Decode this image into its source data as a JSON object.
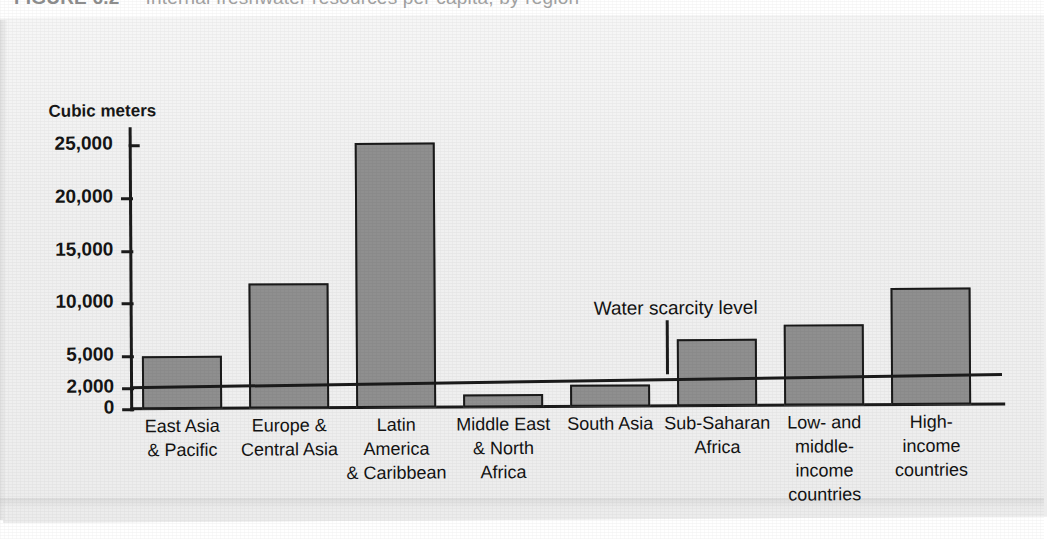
{
  "caption": {
    "number": "FIGURE 6.2",
    "text": "Internal freshwater resources per capita, by region"
  },
  "chart_data": {
    "type": "bar",
    "title": "",
    "ylabel": "Cubic meters",
    "xlabel": "",
    "ylim": [
      0,
      25000
    ],
    "grid": false,
    "legend": "none",
    "ytick_labels": [
      "25,000",
      "20,000",
      "15,000",
      "10,000",
      "5,000",
      "2,000",
      "0"
    ],
    "ytick_values": [
      25000,
      20000,
      15000,
      10000,
      5000,
      2000,
      0
    ],
    "categories": [
      "East Asia & Pacific",
      "Europe & Central Asia",
      "Latin America & Caribbean",
      "Middle East & North Africa",
      "South Asia",
      "Sub-Saharan Africa",
      "Low- and middle-income countries",
      "High-income countries"
    ],
    "category_lines": [
      [
        "East Asia",
        "& Pacific"
      ],
      [
        "Europe &",
        "Central Asia"
      ],
      [
        "Latin",
        "America",
        "& Caribbean"
      ],
      [
        "Middle East",
        "& North",
        "Africa"
      ],
      [
        "South Asia"
      ],
      [
        "Sub-Saharan",
        "Africa"
      ],
      [
        "Low- and",
        "middle-",
        "income",
        "countries"
      ],
      [
        "High-",
        "income",
        "countries"
      ]
    ],
    "values": [
      5000,
      11800,
      25100,
      1200,
      2100,
      6300,
      7700,
      11100
    ],
    "annotations": [
      {
        "label": "Water scarcity level",
        "value": 2000,
        "type": "horizontal-reference-line"
      }
    ],
    "colors": {
      "bar_fill": "#8f8f8f",
      "bar_border": "#1a1a1a",
      "axis": "#1b1b1b",
      "text": "#131313",
      "panel_background": "#f1f1f1"
    }
  }
}
